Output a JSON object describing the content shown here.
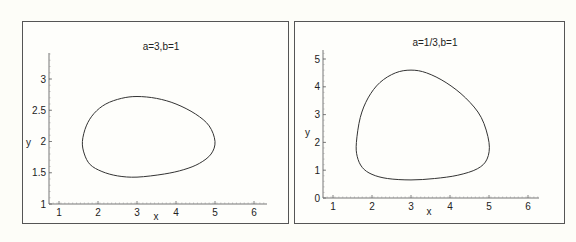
{
  "chart_data": [
    {
      "type": "line",
      "title": "a=3,b=1",
      "xlabel": "x",
      "ylabel": "y",
      "xlim": [
        0.75,
        6.25
      ],
      "ylim": [
        1,
        3.4
      ],
      "xticks": [
        1,
        2,
        3,
        4,
        5,
        6
      ],
      "yticks": [
        1,
        1.5,
        2,
        2.5,
        3
      ],
      "ytick_labels": [
        "1",
        "1.5",
        "2",
        "2.5",
        "3"
      ],
      "grid": false,
      "legend": null,
      "series": [
        {
          "name": "orbit",
          "closed": true,
          "x": [
            1.6,
            1.7,
            1.9,
            2.2,
            2.6,
            3.0,
            3.5,
            4.0,
            4.5,
            4.85,
            5.0,
            4.9,
            4.6,
            4.2,
            3.7,
            3.0,
            2.5,
            2.1,
            1.8,
            1.65,
            1.6
          ],
          "y": [
            2.0,
            2.25,
            2.45,
            2.6,
            2.69,
            2.72,
            2.69,
            2.6,
            2.44,
            2.25,
            2.0,
            1.8,
            1.65,
            1.55,
            1.48,
            1.43,
            1.45,
            1.52,
            1.63,
            1.8,
            2.0
          ]
        }
      ]
    },
    {
      "type": "line",
      "title": "a=1/3,b=1",
      "xlabel": "x",
      "ylabel": "y",
      "xlim": [
        0.75,
        6.25
      ],
      "ylim": [
        0,
        5.2
      ],
      "xticks": [
        1,
        2,
        3,
        4,
        5,
        6
      ],
      "yticks": [
        0,
        1,
        2,
        3,
        4,
        5
      ],
      "ytick_labels": [
        "0",
        "1",
        "2",
        "3",
        "4",
        "5"
      ],
      "grid": false,
      "legend": null,
      "series": [
        {
          "name": "orbit",
          "closed": true,
          "x": [
            1.6,
            1.7,
            1.9,
            2.2,
            2.6,
            3.0,
            3.4,
            3.9,
            4.4,
            4.8,
            5.0,
            4.95,
            4.7,
            4.2,
            3.6,
            3.0,
            2.4,
            2.0,
            1.75,
            1.62,
            1.6
          ],
          "y": [
            2.0,
            2.9,
            3.6,
            4.15,
            4.5,
            4.6,
            4.5,
            4.15,
            3.6,
            2.9,
            2.0,
            1.4,
            1.05,
            0.82,
            0.7,
            0.65,
            0.7,
            0.85,
            1.1,
            1.5,
            2.0
          ]
        }
      ]
    }
  ],
  "panels": [
    {
      "title": "a=3,b=1",
      "xlabel": "x",
      "ylabel": "y"
    },
    {
      "title": "a=1/3,b=1",
      "xlabel": "x",
      "ylabel": "y"
    }
  ]
}
